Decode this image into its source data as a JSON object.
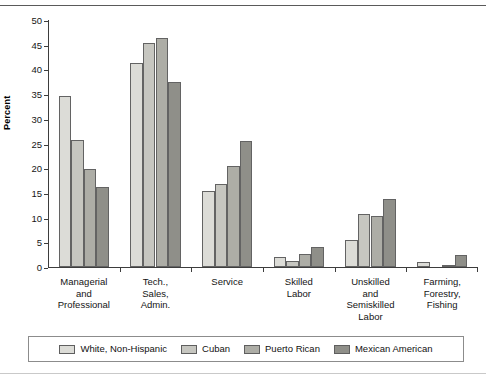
{
  "chart_data": {
    "type": "bar",
    "title": "",
    "xlabel": "",
    "ylabel": "Percent",
    "ylim": [
      0,
      50
    ],
    "ytick_step": 5,
    "yticks": [
      0,
      5,
      10,
      15,
      20,
      25,
      30,
      35,
      40,
      45,
      50
    ],
    "grid": false,
    "legend_position": "bottom",
    "categories": [
      "Managerial and Professional",
      "Tech., Sales, Admin.",
      "Service",
      "Skilled Labor",
      "Unskilled and Semiskilled Labor",
      "Farming, Forestry, Fishing"
    ],
    "category_lines": [
      [
        "Managerial",
        "and",
        "Professional"
      ],
      [
        "Tech.,",
        "Sales,",
        "Admin."
      ],
      [
        "Service"
      ],
      [
        "Skilled",
        "Labor"
      ],
      [
        "Unskilled",
        "and",
        "Semiskilled",
        "Labor"
      ],
      [
        "Farming,",
        "Forestry,",
        "Fishing"
      ]
    ],
    "series": [
      {
        "name": "White, Non-Hispanic",
        "color": "#dcdcd7",
        "values": [
          34.7,
          41.2,
          15.4,
          2.1,
          5.4,
          1.1
        ]
      },
      {
        "name": "Cuban",
        "color": "#c6c6c0",
        "values": [
          25.8,
          45.3,
          16.8,
          1.3,
          10.7,
          0.0
        ]
      },
      {
        "name": "Puerto Rican",
        "color": "#adada6",
        "values": [
          19.8,
          46.3,
          20.4,
          2.6,
          10.3,
          0.2
        ]
      },
      {
        "name": "Mexican American",
        "color": "#8f8f89",
        "values": [
          16.2,
          37.5,
          25.5,
          4.0,
          13.8,
          2.5
        ]
      }
    ]
  },
  "axis": {
    "y_title": "Percent"
  }
}
